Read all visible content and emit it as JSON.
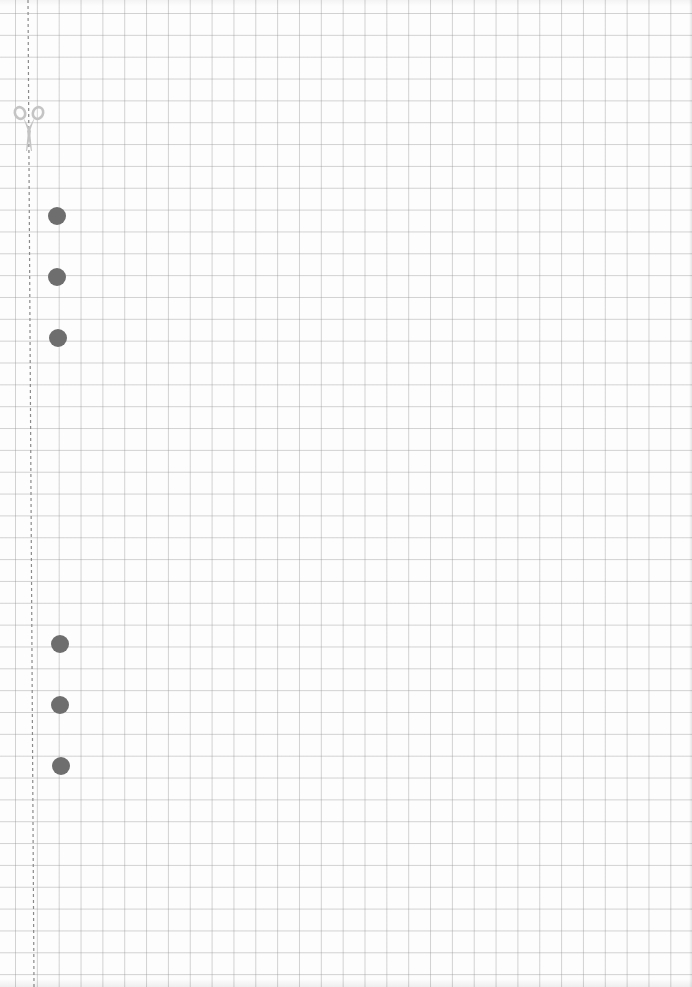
{
  "page": {
    "type": "grid-paper-sheet",
    "grid_spacing_px": 21.85,
    "grid_color": "#969696",
    "background_color": "#fdfdfd"
  },
  "cut_line": {
    "style": "dashed",
    "color": "#8a8a8a",
    "x_top": 28,
    "x_bottom": 34
  },
  "scissors_icon": {
    "color": "#c4c4c4",
    "x": 28,
    "y": 128
  },
  "punch_holes": {
    "color": "#6e6e6e",
    "diameter": 18,
    "items": [
      {
        "x": 57,
        "y": 216
      },
      {
        "x": 57,
        "y": 277
      },
      {
        "x": 58,
        "y": 338
      },
      {
        "x": 60,
        "y": 644
      },
      {
        "x": 60,
        "y": 705
      },
      {
        "x": 61,
        "y": 766
      }
    ]
  }
}
